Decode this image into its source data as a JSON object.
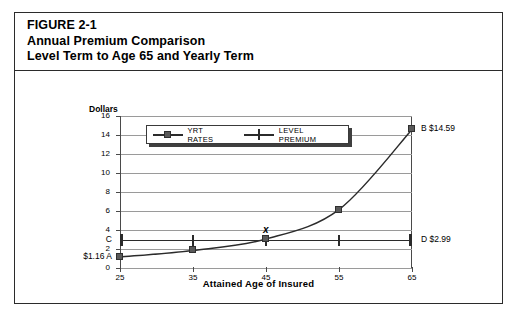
{
  "figure": {
    "title_lines": [
      "FIGURE 2-1",
      "Annual Premium Comparison",
      "Level Term to Age 65 and Yearly Term"
    ]
  },
  "chart_data": {
    "type": "line",
    "xlabel": "Attained Age of Insured",
    "ylabel": "Dollars",
    "x": [
      25,
      35,
      45,
      55,
      65
    ],
    "xticklabels": [
      "25",
      "35",
      "45",
      "55",
      "65"
    ],
    "xlim": [
      25,
      65
    ],
    "ylim": [
      0,
      16
    ],
    "yticklabels": [
      "0",
      "2",
      "4",
      "6",
      "8",
      "10",
      "12",
      "14",
      "16"
    ],
    "yticks": [
      0,
      2,
      4,
      6,
      8,
      10,
      12,
      14,
      16
    ],
    "grid": true,
    "legend_position": "top-left-inside",
    "series": [
      {
        "name": "YRT RATES",
        "marker": "square",
        "values": [
          1.16,
          1.85,
          3.05,
          6.15,
          14.59
        ]
      },
      {
        "name": "LEVEL PREMIUM",
        "marker": "vertical-tick",
        "values": [
          2.99,
          2.99,
          2.99,
          2.99,
          2.99
        ]
      }
    ],
    "annotations": [
      {
        "id": "A",
        "text": "$1.16  A",
        "x": 25,
        "y": 1.16,
        "placement": "left"
      },
      {
        "id": "C",
        "text": "C",
        "x": 25,
        "y": 2.99,
        "placement": "left"
      },
      {
        "id": "B",
        "text": "B $14.59",
        "x": 65,
        "y": 14.59,
        "placement": "right"
      },
      {
        "id": "D",
        "text": "D $2.99",
        "x": 65,
        "y": 2.99,
        "placement": "right"
      },
      {
        "id": "X",
        "text": "x",
        "x": 45,
        "y": 3.9,
        "placement": "above"
      }
    ]
  },
  "legend": {
    "items": [
      {
        "label": "YRT RATES",
        "symbol": "square-marker"
      },
      {
        "label": "LEVEL PREMIUM",
        "symbol": "tick-marker"
      }
    ]
  },
  "colors": {
    "frame": "#2b2b2b",
    "gridline": "#9a9a9a",
    "axis": "#4a4a4a",
    "series_yrt": "#595959",
    "series_level": "#2b2b2b",
    "background": "#ffffff"
  }
}
